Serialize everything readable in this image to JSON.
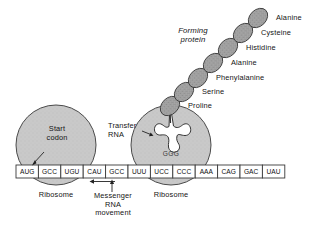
{
  "diagram": {
    "title_labels": {
      "forming_protein_line1": "Forming",
      "forming_protein_line2": "protein",
      "start_codon_line1": "Start",
      "start_codon_line2": "codon",
      "transfer_rna_line1": "Transfer",
      "transfer_rna_line2": "RNA",
      "mrna_move_line1": "Messenger",
      "mrna_move_line2": "RNA",
      "mrna_move_line3": "movement",
      "ribosome_left": "Ribosome",
      "ribosome_right": "Ribosome"
    },
    "amino_acids": [
      {
        "name": "Alanine",
        "cx": 258,
        "cy": 18,
        "lx": 276,
        "ly": 14
      },
      {
        "name": "Cysteine",
        "cx": 243,
        "cy": 33,
        "lx": 261,
        "ly": 29
      },
      {
        "name": "Histidine",
        "cx": 228,
        "cy": 48,
        "lx": 246,
        "ly": 44
      },
      {
        "name": "Alanine",
        "cx": 213,
        "cy": 63,
        "lx": 231,
        "ly": 59
      },
      {
        "name": "Phenylalanine",
        "cx": 198,
        "cy": 78,
        "lx": 216,
        "ly": 74
      },
      {
        "name": "Serine",
        "cx": 184,
        "cy": 92,
        "lx": 202,
        "ly": 88
      },
      {
        "name": "Proline",
        "cx": 170,
        "cy": 106,
        "lx": 188,
        "ly": 102
      }
    ],
    "mrna_codons": [
      "AUG",
      "GCC",
      "UGU",
      "CAU",
      "GCC",
      "UUU",
      "UCC",
      "CCC",
      "AAA",
      "CAG",
      "GAC",
      "UAU"
    ],
    "anticodon": "GGG",
    "colors": {
      "ribosome_fill": "#c9c9c9",
      "ribosome_stroke": "#4a4a4a",
      "bead_fill": "#9a9a9a",
      "bead_stroke": "#3d3d3d",
      "codon_box_fill": "#ffffff",
      "codon_box_stroke": "#3a3a3a",
      "trna_fill": "#ffffff",
      "trna_stroke": "#333333",
      "background": "#ffffff",
      "text": "#141414"
    },
    "geometry": {
      "ribosome_left_cx": 56,
      "ribosome_right_cx": 171,
      "ribosome_cy": 145,
      "ribosome_r": 40,
      "strip_x": 16,
      "strip_y": 165,
      "strip_box_w": 22.4,
      "strip_box_h": 13
    }
  }
}
